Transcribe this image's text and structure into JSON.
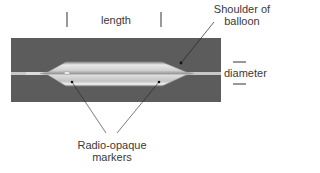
{
  "diagram": {
    "labels": {
      "length": "length",
      "shoulder_line1": "Shoulder of",
      "shoulder_line2": "balloon",
      "diameter": "diameter",
      "markers_line1": "Radio-opaque",
      "markers_line2": "markers"
    },
    "colors": {
      "background_panel": "#5c5c5c",
      "balloon_light": "#e6e6e6",
      "balloon_mid": "#b8b8b8",
      "wire": "#cfcfcf",
      "annotation": "#222222"
    }
  }
}
